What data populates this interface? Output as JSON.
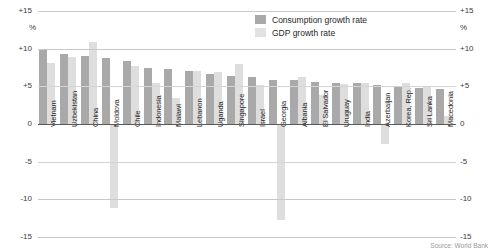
{
  "chart_data": {
    "type": "bar",
    "title": "",
    "xlabel": "",
    "ylabel": "%",
    "ylim": [
      -15,
      15
    ],
    "yticks": [
      "+15",
      "+10",
      "+5",
      "0",
      "-5",
      "-10",
      "-15"
    ],
    "ytick_values": [
      15,
      10,
      5,
      0,
      -5,
      -10,
      -15
    ],
    "grid": true,
    "legend_position": "top-right",
    "unit_label": "%",
    "categories": [
      "Vietnam",
      "Uzbekistan",
      "China",
      "Moldova",
      "Chile",
      "Indonesia",
      "Malawi",
      "Lebanon",
      "Uganda",
      "Singapore",
      "Israel",
      "Georgia",
      "Albania",
      "El Salvador",
      "Uruguay",
      "India",
      "Azerbaijan",
      "Korea, Rep.",
      "Sri Lanka",
      "Macedonia"
    ],
    "series": [
      {
        "name": "Consumption growth rate",
        "color": "#a9a9a9",
        "values": [
          9.9,
          9.3,
          9.0,
          8.7,
          8.4,
          7.4,
          7.3,
          7.0,
          6.6,
          6.4,
          6.2,
          5.9,
          5.8,
          5.6,
          5.5,
          5.4,
          5.2,
          5.0,
          4.8,
          4.6
        ]
      },
      {
        "name": "GDP growth rate",
        "color": "#dedede",
        "values": [
          8.1,
          8.9,
          10.9,
          0.0,
          7.7,
          5.4,
          3.5,
          7.1,
          6.9,
          8.0,
          5.2,
          0.0,
          6.3,
          3.9,
          5.3,
          5.4,
          0.0,
          5.4,
          5.1,
          1.0
        ]
      }
    ],
    "negative_gdp_bars": {
      "Moldova": -11.2,
      "Georgia": -12.7,
      "Azerbaijan": -2.6
    },
    "legend": [
      {
        "label": "Consumption growth rate",
        "swatch": "consumption"
      },
      {
        "label": "GDP growth rate",
        "swatch": "gdp"
      }
    ],
    "source": "Source: World Bank"
  }
}
